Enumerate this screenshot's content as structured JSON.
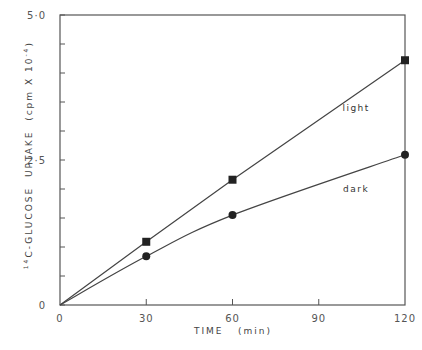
{
  "chart_data": {
    "type": "line",
    "title": "",
    "xlabel": "TIME   (min)",
    "ylabel": "14C-GLUCOSE  UPTAKE  (cpm X 10^-4)",
    "ylabel_parts": {
      "superscript_pre": "14",
      "main": "C-GLUCOSE  UPTAKE  (cpm X 10",
      "exponent": "-4",
      "close": ")"
    },
    "x": [
      0,
      30,
      60,
      120
    ],
    "xlim": [
      0,
      120
    ],
    "ylim": [
      0,
      5.0
    ],
    "xticks": [
      0,
      30,
      60,
      90,
      120
    ],
    "xtick_labels": [
      "0",
      "30",
      "60",
      "90",
      "120"
    ],
    "yticks_labeled": [
      0,
      2.5,
      5.0
    ],
    "ytick_labels": [
      "0",
      "2·5",
      "5·0"
    ],
    "yticks_minor_step": 0.5,
    "grid": false,
    "legend": "inline labels",
    "series": [
      {
        "name": "light",
        "marker": "square",
        "values": [
          0,
          1.09,
          2.16,
          4.22
        ],
        "label_pos": {
          "x": 103,
          "y": 3.35
        }
      },
      {
        "name": "dark",
        "marker": "circle",
        "values": [
          0,
          0.84,
          1.55,
          2.59
        ],
        "label_pos": {
          "x": 103,
          "y": 1.95
        }
      }
    ]
  }
}
